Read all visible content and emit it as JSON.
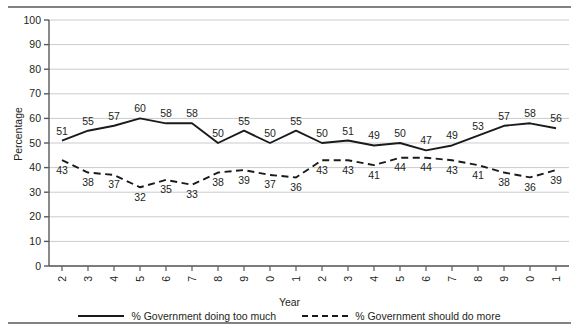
{
  "figure": {
    "y_axis_label": "Percentage",
    "x_axis_label": "Year"
  },
  "legend": {
    "series1_label": "% Government doing too much",
    "series2_label": "% Government should do more"
  },
  "chart_data": {
    "type": "line",
    "title": "",
    "xlabel": "Year",
    "ylabel": "Percentage",
    "ylim": [
      0,
      100
    ],
    "yticks": [
      0,
      10,
      20,
      30,
      40,
      50,
      60,
      70,
      80,
      90,
      100
    ],
    "grid": "horizontal",
    "legend_position": "bottom",
    "data_labels": true,
    "categories": [
      "1992",
      "1993",
      "1994",
      "1995",
      "1996",
      "1997",
      "1998",
      "1999",
      "2000",
      "2001",
      "2002",
      "2003",
      "2004",
      "2005",
      "2006",
      "2007",
      "2008",
      "2009",
      "2010",
      "2011"
    ],
    "series": [
      {
        "name": "% Government doing too much",
        "style": "solid",
        "color": "#1a1a1a",
        "values": [
          51,
          55,
          57,
          60,
          58,
          58,
          50,
          55,
          50,
          55,
          50,
          51,
          49,
          50,
          47,
          49,
          53,
          57,
          58,
          56
        ]
      },
      {
        "name": "% Government should do more",
        "style": "dashed",
        "color": "#1a1a1a",
        "values": [
          43,
          38,
          37,
          32,
          35,
          33,
          38,
          39,
          37,
          36,
          43,
          43,
          41,
          44,
          44,
          43,
          41,
          38,
          36,
          39
        ]
      }
    ]
  }
}
